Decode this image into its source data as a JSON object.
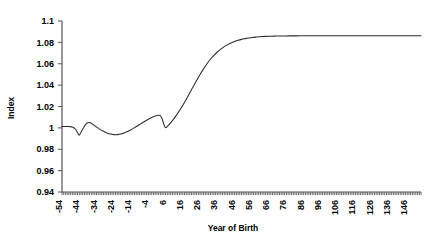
{
  "chart_data": {
    "type": "line",
    "title": "",
    "xlabel": "Year of Birth",
    "ylabel": "Index",
    "xlim": [
      -54,
      154
    ],
    "ylim": [
      0.94,
      1.1
    ],
    "grid": false,
    "legend": null,
    "y_ticks": [
      "1.1",
      "1.08",
      "1.06",
      "1.04",
      "1.02",
      "1",
      "0.98",
      "0.96",
      "0.94"
    ],
    "y_tick_values": [
      1.1,
      1.08,
      1.06,
      1.04,
      1.02,
      1.0,
      0.98,
      0.96,
      0.94
    ],
    "x_ticks": [
      "-54",
      "-44",
      "-34",
      "-24",
      "-14",
      "-4",
      "6",
      "16",
      "26",
      "36",
      "46",
      "56",
      "66",
      "76",
      "86",
      "96",
      "106",
      "116",
      "126",
      "136",
      "146"
    ],
    "x_tick_values": [
      -54,
      -44,
      -34,
      -24,
      -14,
      -4,
      6,
      16,
      26,
      36,
      46,
      56,
      66,
      76,
      86,
      96,
      106,
      116,
      126,
      136,
      146
    ],
    "x_minor_tick_step": 1,
    "line_color": "#2b2b2b",
    "axis_color": "#555555",
    "series": [
      {
        "name": "Index",
        "x": [
          -54,
          -52,
          -50,
          -48,
          -46,
          -45,
          -44,
          -43,
          -42,
          -41,
          -40,
          -39,
          -38,
          -37,
          -36,
          -35,
          -34,
          -32,
          -30,
          -28,
          -26,
          -24,
          -22,
          -20,
          -18,
          -16,
          -14,
          -12,
          -10,
          -8,
          -6,
          -4,
          -2,
          0,
          2,
          3,
          4,
          5,
          6,
          8,
          10,
          12,
          14,
          16,
          18,
          20,
          22,
          24,
          26,
          28,
          30,
          32,
          34,
          36,
          38,
          40,
          42,
          44,
          46,
          48,
          50,
          52,
          54,
          56,
          58,
          60,
          62,
          64,
          66,
          68,
          70,
          74,
          78,
          82,
          86,
          90,
          94,
          98,
          106,
          116,
          126,
          136,
          146,
          154
        ],
        "y": [
          1.0012,
          1.0013,
          1.0012,
          1.0008,
          0.9985,
          0.9955,
          0.9932,
          0.996,
          0.9988,
          1.0015,
          1.0038,
          1.0048,
          1.005,
          1.0043,
          1.0032,
          1.002,
          1.0008,
          0.9986,
          0.9968,
          0.9953,
          0.9942,
          0.9937,
          0.9937,
          0.9942,
          0.9952,
          0.9966,
          0.9983,
          1.0002,
          1.0022,
          1.0042,
          1.0062,
          1.008,
          1.0098,
          1.011,
          1.0118,
          1.0115,
          1.0085,
          1.0035,
          1.0002,
          1.003,
          1.0068,
          1.0112,
          1.016,
          1.0212,
          1.0268,
          1.0326,
          1.0385,
          1.0444,
          1.05,
          1.0552,
          1.06,
          1.0642,
          1.0678,
          1.071,
          1.0737,
          1.076,
          1.0779,
          1.0795,
          1.0808,
          1.0819,
          1.0828,
          1.0835,
          1.0841,
          1.0845,
          1.0849,
          1.0852,
          1.0854,
          1.0856,
          1.0857,
          1.0858,
          1.0859,
          1.086,
          1.0861,
          1.0861,
          1.0862,
          1.0862,
          1.0862,
          1.0862,
          1.0862,
          1.0862,
          1.0862,
          1.0862,
          1.0862,
          1.0862
        ]
      }
    ]
  },
  "axes": {
    "y_axis_title": "Index",
    "x_axis_title": "Year of Birth"
  }
}
